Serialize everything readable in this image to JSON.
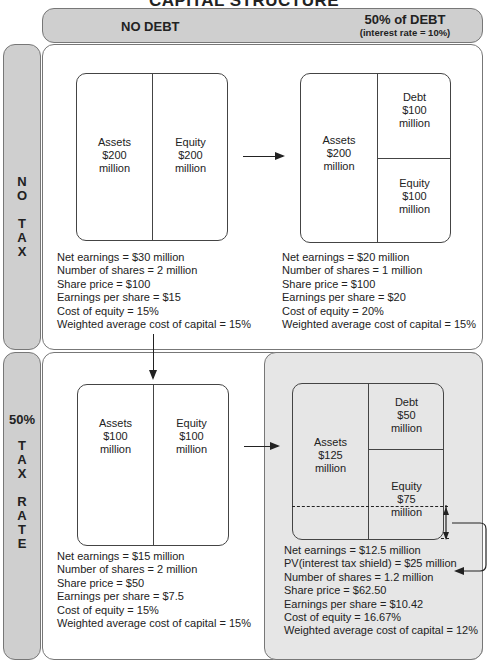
{
  "title": "CAPITAL STRUCTURE",
  "columns": {
    "no_debt": "NO DEBT",
    "debt": "50% of DEBT",
    "debt_note": "(interest rate = 10%)"
  },
  "rows": {
    "no_tax": [
      "N",
      "O",
      "",
      "T",
      "A",
      "X"
    ],
    "tax_pct": "50%",
    "tax_letters": [
      "T",
      "A",
      "X",
      "",
      "R",
      "A",
      "T",
      "E"
    ]
  },
  "quadrants": {
    "no_tax_no_debt": {
      "assets": [
        "Assets",
        "$200",
        "million"
      ],
      "equity": [
        "Equity",
        "$200",
        "million"
      ],
      "stats": [
        "Net earnings = $30 million",
        "Number of shares = 2 million",
        "Share price = $100",
        "Earnings per share = $15",
        "Cost of equity = 15%",
        "Weighted average cost of capital = 15%"
      ]
    },
    "no_tax_debt": {
      "assets": [
        "Assets",
        "$200",
        "million"
      ],
      "debt": [
        "Debt",
        "$100",
        "million"
      ],
      "equity": [
        "Equity",
        "$100",
        "million"
      ],
      "stats": [
        "Net earnings = $20 million",
        "Number of shares = 1 million",
        "Share price = $100",
        "Earnings per share = $20",
        "Cost of equity = 20%",
        "Weighted average cost of capital = 15%"
      ]
    },
    "tax_no_debt": {
      "assets": [
        "Assets",
        "$100",
        "million"
      ],
      "equity": [
        "Equity",
        "$100",
        "million"
      ],
      "stats": [
        "Net earnings = $15 million",
        "Number of shares = 2 million",
        "Share price = $50",
        "Earnings per share = $7.5",
        "Cost of equity = 15%",
        "Weighted average cost of capital = 15%"
      ]
    },
    "tax_debt": {
      "assets": [
        "Assets",
        "$125",
        "million"
      ],
      "debt": [
        "Debt",
        "$50",
        "million"
      ],
      "equity": [
        "Equity",
        "$75",
        "million"
      ],
      "stats": [
        "Net earnings = $12.5 million",
        "PV(interest tax shield) = $25 million",
        "Number of shares = 1.2 million",
        "Share price = $62.50",
        "Earnings per share = $10.42",
        "Cost of equity = 16.67%",
        "Weighted average cost of capital = 12%"
      ]
    }
  },
  "colors": {
    "header_fill": "#cfcfcf",
    "shaded_fill": "#e6e6e6",
    "line": "#444444"
  }
}
